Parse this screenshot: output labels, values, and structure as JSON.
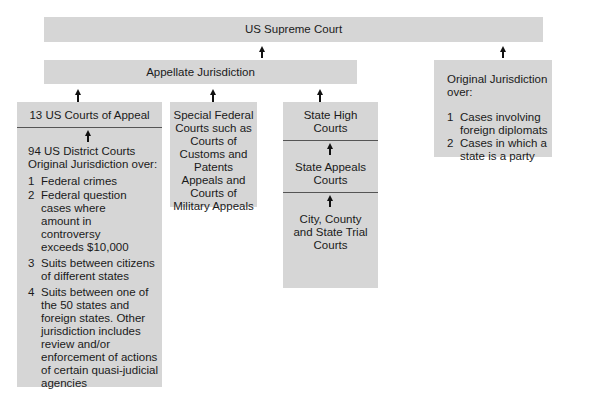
{
  "supreme_court": {
    "label": "US Supreme Court"
  },
  "appellate": {
    "label": "Appellate Jurisdiction"
  },
  "original_jurisdiction": {
    "heading": "Original Jurisdiction over:",
    "items": [
      {
        "num": "1",
        "text": "Cases involving foreign diplomats"
      },
      {
        "num": "2",
        "text": "Cases in which a state is a party"
      }
    ]
  },
  "courts_of_appeal": {
    "label": "13 US Courts of Appeal",
    "district": {
      "heading_line1": "94 US District Courts",
      "heading_line2": "Original Jurisdiction over:",
      "items": [
        {
          "num": "1",
          "text": "Federal crimes"
        },
        {
          "num": "2",
          "text": "Federal question cases where amount in controversy exceeds $10,000"
        },
        {
          "num": "3",
          "text": "Suits between citizens of different states"
        },
        {
          "num": "4",
          "text": "Suits between one of the 50 states and foreign states. Other jurisdiction includes review and/or enforcement of actions of certain quasi-judicial agencies"
        }
      ]
    }
  },
  "special_federal": {
    "label": "Special Federal Courts such as Courts of Customs and Patents Appeals and Courts of Military Appeals"
  },
  "state_courts": {
    "high": "State High Courts",
    "appeals": "State Appeals Courts",
    "trial": "City, County and State Trial Courts"
  },
  "colors": {
    "box_fill": "#d6d6d6",
    "arrow": "#111111",
    "divider": "#555555"
  }
}
